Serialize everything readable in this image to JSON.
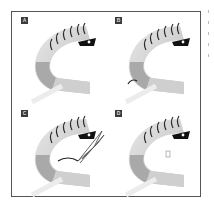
{
  "figure": {
    "panels": [
      {
        "label": "A",
        "stage": "lower-lid-anatomy",
        "has_suture": false,
        "has_forceps": false,
        "has_marker": false
      },
      {
        "label": "B",
        "stage": "suture-placement",
        "has_suture": true,
        "has_forceps": false,
        "has_marker": false
      },
      {
        "label": "C",
        "stage": "forceps-manipulation",
        "has_suture": true,
        "has_forceps": true,
        "has_marker": false
      },
      {
        "label": "D",
        "stage": "result",
        "has_suture": false,
        "has_forceps": false,
        "has_marker": true
      }
    ],
    "colors": {
      "frame": "#555555",
      "label_bg": "#3a3a3a",
      "lash": "#2a2a2a",
      "eye_dark": "#111111",
      "lid_light": "#d4d4d4",
      "lid_mid": "#b0b0b0",
      "tarsus": "#9a9a9a"
    }
  }
}
